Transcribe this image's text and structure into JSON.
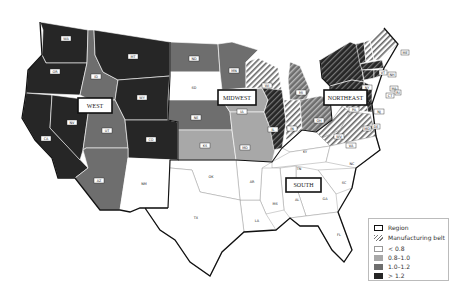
{
  "colors": {
    "lt08": "#ffffff",
    "c08_10": "#a8a8a8",
    "c10_12": "#6e6e6e",
    "gt12": "#262626",
    "border": "#111111"
  },
  "regions": [
    {
      "label": "WEST"
    },
    {
      "label": "MIDWEST"
    },
    {
      "label": "NORTHEAST"
    },
    {
      "label": "SOUTH"
    }
  ],
  "states": {
    "WA": "WA",
    "OR": "OR",
    "CA": "CA",
    "NV": "NV",
    "ID": "ID",
    "MT": "MT",
    "WY": "WY",
    "UT": "UT",
    "CO": "CO",
    "AZ": "AZ",
    "NM": "NM",
    "ND": "ND",
    "SD": "SD",
    "NE": "NE",
    "KS": "KS",
    "MN": "MN",
    "IA": "IA",
    "MO": "MO",
    "WI": "WI",
    "IL": "IL",
    "MI": "MI",
    "IN": "IN",
    "OH": "OH",
    "NY": "NY",
    "PA": "PA",
    "NJ": "NJ",
    "VT": "VT",
    "NH": "NH",
    "ME": "ME",
    "MA": "MA",
    "CT": "CT",
    "RI": "RI",
    "MD": "MD",
    "DE": "DE",
    "WV": "WV",
    "VA": "VA",
    "KY": "KY",
    "TN": "TN",
    "NC": "NC",
    "SC": "SC",
    "GA": "GA",
    "AL": "AL",
    "MS": "MS",
    "LA": "LA",
    "AR": "AR",
    "OK": "OK",
    "TX": "TX",
    "FL": "FL"
  },
  "legend": {
    "region": "Region",
    "manufacturing_belt": "Manufacturing belt",
    "c0": "< 0.8",
    "c1": "0.8–1.0",
    "c2": "1.0–1.2",
    "c3": "> 1.2"
  }
}
